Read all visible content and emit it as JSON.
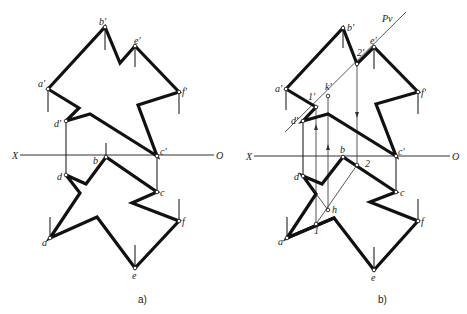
{
  "figure": {
    "panel_a": {
      "caption": "a)",
      "axis": {
        "left_label": "X",
        "right_label": "O"
      },
      "labels": {
        "b_prime": "b'",
        "e_prime": "e'",
        "a_prime": "a'",
        "f_prime": "f'",
        "d_prime": "d'",
        "c_prime": "c'",
        "b": "b",
        "d": "d",
        "c": "c",
        "f": "f",
        "a": "a",
        "e": "e"
      }
    },
    "panel_b": {
      "caption": "b)",
      "plane_label": "Pv",
      "axis": {
        "left_label": "X",
        "right_label": "O"
      },
      "labels": {
        "b_prime": "b'",
        "e_prime": "e'",
        "a_prime": "a'",
        "f_prime": "f'",
        "d_prime": "d'",
        "c_prime": "c'",
        "p2_prime": "2'",
        "p1_prime": "1'",
        "k_prime": "k'",
        "b": "b",
        "p2": "2",
        "d": "d",
        "c": "c",
        "f": "f",
        "a": "a",
        "e": "e",
        "h": "h",
        "p1": "1"
      }
    }
  }
}
